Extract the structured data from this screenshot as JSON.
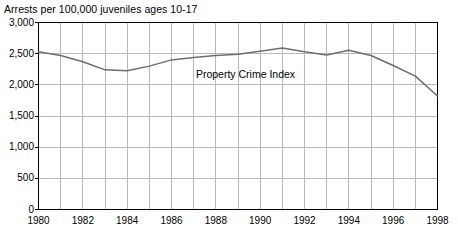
{
  "chart_data": {
    "type": "line",
    "title": "Arrests per 100,000 juveniles ages 10-17",
    "xlabel": "",
    "ylabel": "",
    "xlim": [
      1980,
      1998
    ],
    "ylim": [
      0,
      3000
    ],
    "grid": true,
    "legend_position": "inline-annotation",
    "x_tick_labels": [
      "1980",
      "1982",
      "1984",
      "1986",
      "1988",
      "1990",
      "1992",
      "1994",
      "1996",
      "1998"
    ],
    "x_tick_values": [
      1980,
      1982,
      1984,
      1986,
      1988,
      1990,
      1992,
      1994,
      1996,
      1998
    ],
    "x_gridline_values": [
      1980,
      1981,
      1982,
      1983,
      1984,
      1985,
      1986,
      1987,
      1988,
      1989,
      1990,
      1991,
      1992,
      1993,
      1994,
      1995,
      1996,
      1997,
      1998
    ],
    "y_tick_labels": [
      "0",
      "500",
      "1,000",
      "1,500",
      "2,000",
      "2,500",
      "3,000"
    ],
    "y_tick_values": [
      0,
      500,
      1000,
      1500,
      2000,
      2500,
      3000
    ],
    "series": [
      {
        "name": "Property Crime Index",
        "color": "#6e6e6e",
        "x": [
          1980,
          1981,
          1982,
          1983,
          1984,
          1985,
          1986,
          1987,
          1988,
          1989,
          1990,
          1991,
          1992,
          1993,
          1994,
          1995,
          1996,
          1997,
          1998
        ],
        "values": [
          2530,
          2470,
          2370,
          2240,
          2225,
          2300,
          2400,
          2440,
          2470,
          2490,
          2540,
          2590,
          2530,
          2480,
          2555,
          2470,
          2310,
          2140,
          1820
        ]
      }
    ],
    "annotations": [
      {
        "text": "Property Crime Index",
        "x": 1987.1,
        "y": 2180
      }
    ]
  },
  "axis": {
    "frame_color": "#000000",
    "grid_color": "#b9b9b9"
  }
}
